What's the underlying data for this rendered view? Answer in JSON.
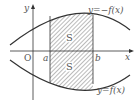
{
  "labels": {
    "y_axis": "y",
    "x_axis": "x",
    "origin": "O",
    "a": "a",
    "b": "b",
    "upper_curve": "y=−f(x)",
    "lower_curve": "y=f(x)",
    "region_upper": "S",
    "region_lower": "S"
  },
  "colors": {
    "line": "#333333",
    "hatch": "#555555",
    "text": "#555555"
  }
}
